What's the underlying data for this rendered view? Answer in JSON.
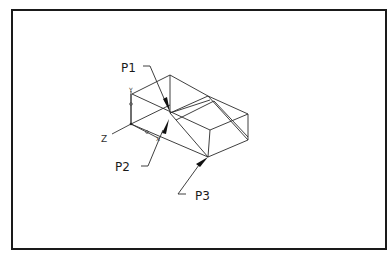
{
  "figure": {
    "border_color": "#1a1a1a",
    "line_color": "#2a2a2a"
  },
  "callouts": [
    {
      "id": "p1",
      "label": "P1"
    },
    {
      "id": "p2",
      "label": "P2"
    },
    {
      "id": "p3",
      "label": "P3"
    }
  ],
  "triad": {
    "z_label": "Z",
    "y_label": "Y",
    "x_label": "X"
  }
}
